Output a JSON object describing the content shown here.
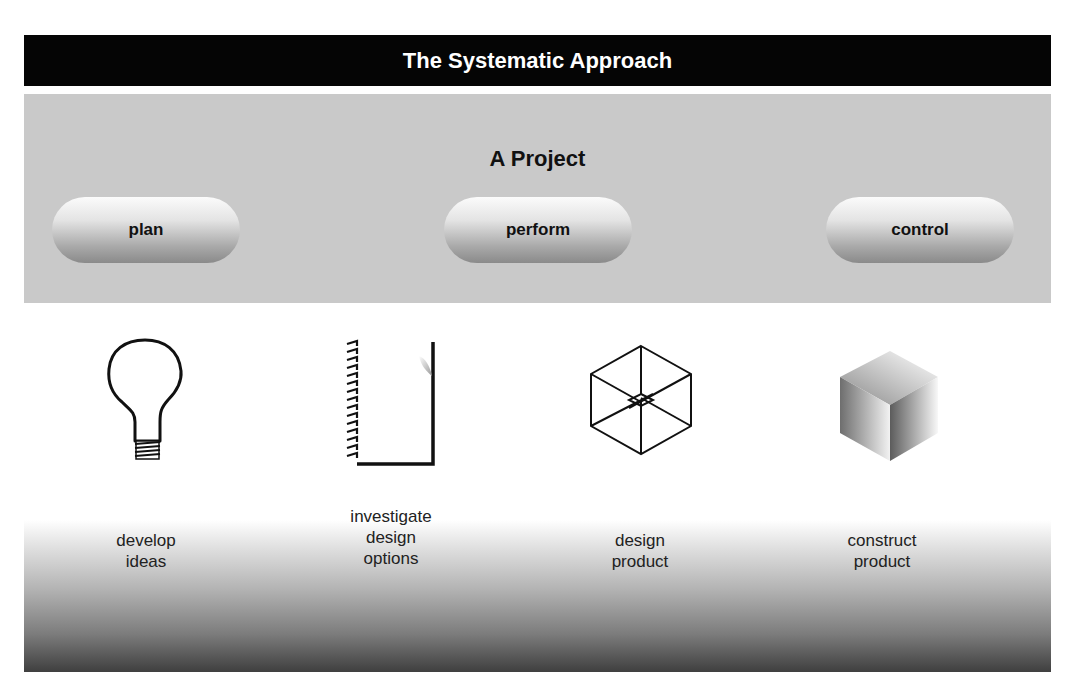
{
  "header": {
    "title": "The Systematic Approach"
  },
  "project": {
    "title": "A Project",
    "phases": [
      {
        "label": "plan"
      },
      {
        "label": "perform"
      },
      {
        "label": "control"
      }
    ]
  },
  "steps": [
    {
      "icon": "lightbulb-icon",
      "line1": "develop",
      "line2": "ideas",
      "line3": ""
    },
    {
      "icon": "notepad-icon",
      "line1": "investigate",
      "line2": "design",
      "line3": "options"
    },
    {
      "icon": "wireframe-cube-icon",
      "line1": "design",
      "line2": "product",
      "line3": ""
    },
    {
      "icon": "solid-cube-icon",
      "line1": "construct",
      "line2": "product",
      "line3": ""
    }
  ],
  "colors": {
    "header_bg": "#050505",
    "header_text": "#ffffff",
    "band_bg": "#c9c9c9"
  }
}
